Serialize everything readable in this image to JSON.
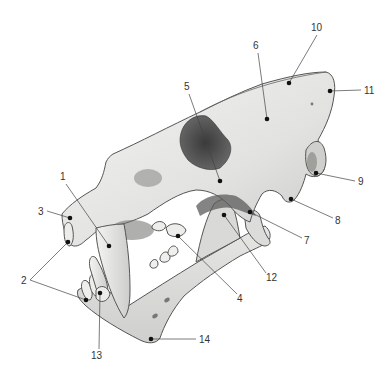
{
  "diagram": {
    "colors": {
      "background": "#ffffff",
      "bone_light": "#f1f1ef",
      "bone_mid": "#d4d4d2",
      "bone_shadow": "#8e8e8c",
      "cavity": "#4a4a4a",
      "line": "#444444",
      "dot": "#111111",
      "label_text": "#333333"
    },
    "labels": [
      {
        "id": "1",
        "text": "1",
        "text_x": 60,
        "text_y": 180,
        "points": [
          [
            109,
            246
          ]
        ],
        "line_start": [
          66,
          184
        ]
      },
      {
        "id": "2",
        "text": "2",
        "text_x": 21,
        "text_y": 284,
        "points": [
          [
            68,
            242
          ],
          [
            86,
            300
          ]
        ],
        "line_start": [
          30,
          280
        ]
      },
      {
        "id": "3",
        "text": "3",
        "text_x": 38,
        "text_y": 215,
        "points": [
          [
            70,
            218
          ]
        ],
        "line_start": [
          47,
          211
        ]
      },
      {
        "id": "4",
        "text": "4",
        "text_x": 237,
        "text_y": 302,
        "points": [
          [
            178,
            236
          ]
        ],
        "line_start": [
          237,
          294
        ]
      },
      {
        "id": "5",
        "text": "5",
        "text_x": 184,
        "text_y": 90,
        "points": [
          [
            220,
            181
          ]
        ],
        "line_start": [
          189,
          94
        ]
      },
      {
        "id": "6",
        "text": "6",
        "text_x": 253,
        "text_y": 49,
        "points": [
          [
            267,
            119
          ]
        ],
        "line_start": [
          258,
          53
        ]
      },
      {
        "id": "7",
        "text": "7",
        "text_x": 304,
        "text_y": 244,
        "points": [
          [
            250,
            212
          ]
        ],
        "line_start": [
          302,
          238
        ]
      },
      {
        "id": "8",
        "text": "8",
        "text_x": 335,
        "text_y": 224,
        "points": [
          [
            291,
            199
          ]
        ],
        "line_start": [
          333,
          218
        ]
      },
      {
        "id": "9",
        "text": "9",
        "text_x": 358,
        "text_y": 185,
        "points": [
          [
            316,
            173
          ]
        ],
        "line_start": [
          355,
          181
        ]
      },
      {
        "id": "10",
        "text": "10",
        "text_x": 311,
        "text_y": 31,
        "points": [
          [
            289,
            83
          ]
        ],
        "line_start": [
          317,
          35
        ]
      },
      {
        "id": "11",
        "text": "11",
        "text_x": 364,
        "text_y": 94,
        "points": [
          [
            330,
            91
          ]
        ],
        "line_start": [
          361,
          90
        ]
      },
      {
        "id": "12",
        "text": "12",
        "text_x": 266,
        "text_y": 281,
        "points": [
          [
            224,
            215
          ]
        ],
        "line_start": [
          266,
          273
        ]
      },
      {
        "id": "13",
        "text": "13",
        "text_x": 91,
        "text_y": 359,
        "points": [
          [
            100,
            293
          ]
        ],
        "line_start": [
          99,
          349
        ]
      },
      {
        "id": "14",
        "text": "14",
        "text_x": 199,
        "text_y": 343,
        "points": [
          [
            151,
            339
          ]
        ],
        "line_start": [
          196,
          339
        ]
      }
    ]
  }
}
